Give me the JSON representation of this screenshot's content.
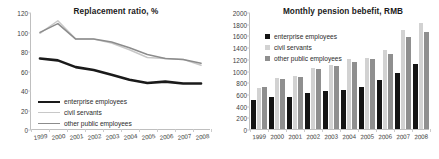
{
  "chart_data": [
    {
      "type": "line",
      "title": "Replacement ratio, %",
      "xlabel": "",
      "ylabel": "",
      "ylim": [
        0,
        120
      ],
      "yticks": [
        0,
        20,
        40,
        60,
        80,
        100,
        120
      ],
      "grid": false,
      "legend_position": "lower-left",
      "categories": [
        "1999",
        "2000",
        "2001",
        "2002",
        "2003",
        "2004",
        "2005",
        "2006",
        "2007",
        "2008"
      ],
      "series": [
        {
          "name": "enterprise employees",
          "color": "#1a1a1a",
          "width": 2.6,
          "values": [
            73,
            71,
            64,
            61,
            56,
            51,
            47.5,
            49,
            47,
            47
          ]
        },
        {
          "name": "civil servants",
          "color": "#c8c8c8",
          "width": 1.5,
          "values": [
            99,
            112,
            93,
            93,
            89,
            82,
            74,
            73,
            72,
            66
          ]
        },
        {
          "name": "other public employees",
          "color": "#8c8c8c",
          "width": 1.5,
          "values": [
            100,
            109,
            93,
            93,
            90,
            84,
            77,
            73,
            72,
            68
          ]
        }
      ]
    },
    {
      "type": "bar",
      "title": "Monthly pension bebefit, RMB",
      "xlabel": "",
      "ylabel": "",
      "ylim": [
        0,
        2000
      ],
      "yticks": [
        0,
        200,
        400,
        600,
        800,
        1000,
        1200,
        1400,
        1600,
        1800,
        2000
      ],
      "grid": false,
      "legend_position": "upper-left",
      "categories": [
        "1999",
        "2000",
        "2001",
        "2002",
        "2003",
        "2004",
        "2005",
        "2006",
        "2007",
        "2008"
      ],
      "series": [
        {
          "name": "enterprise employees",
          "color": "#141414",
          "values": [
            500,
            545,
            555,
            620,
            645,
            670,
            725,
            840,
            950,
            1115
          ]
        },
        {
          "name": "civil servants",
          "color": "#d2d2d2",
          "values": [
            705,
            880,
            905,
            1045,
            1090,
            1195,
            1215,
            1345,
            1700,
            1820
          ]
        },
        {
          "name": "other public employees",
          "color": "#8f8f8f",
          "values": [
            720,
            855,
            890,
            1025,
            1070,
            1145,
            1200,
            1285,
            1580,
            1660
          ]
        }
      ]
    }
  ]
}
